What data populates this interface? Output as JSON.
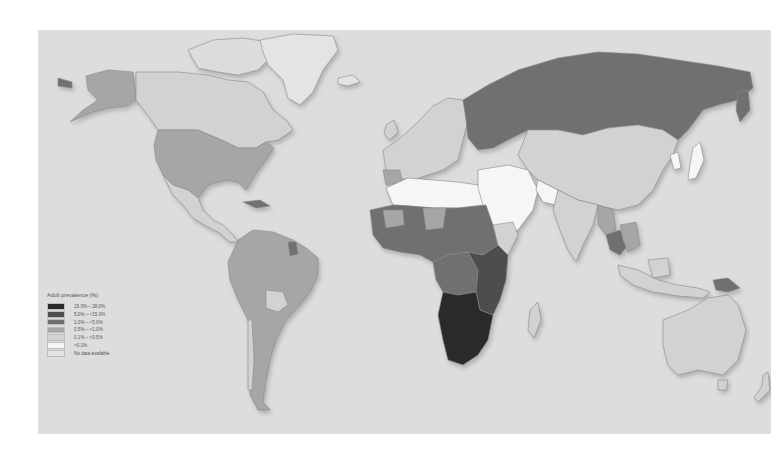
{
  "map": {
    "title": "Adult HIV prevalence world map",
    "ocean_color": "#dddddd",
    "border_color": "#8a8a8a",
    "shadow_color": "#b8b8b8"
  },
  "legend": {
    "title": "Adult prevalence (%)",
    "items": [
      {
        "label": "15.0% – 28.0%",
        "color": "#2a2a2a"
      },
      {
        "label": "5.0% – <15.0%",
        "color": "#4d4d4d"
      },
      {
        "label": "1.0% – <5.0%",
        "color": "#6f6f6f"
      },
      {
        "label": "0.5% – <1.0%",
        "color": "#a6a6a6"
      },
      {
        "label": "0.1% – <0.5%",
        "color": "#d2d2d2"
      },
      {
        "label": "<0.1%",
        "color": "#f6f6f6"
      },
      {
        "label": "No data available",
        "color": "#e4e4e4"
      }
    ]
  },
  "regions": [
    {
      "name": "Greenland",
      "category": "No data available"
    },
    {
      "name": "Canada",
      "category": "0.1% – <0.5%"
    },
    {
      "name": "Alaska / USA",
      "category": "0.5% – <1.0%"
    },
    {
      "name": "Mexico / Central America",
      "category": "0.1% – <0.5%"
    },
    {
      "name": "South America",
      "category": "0.5% – <1.0%"
    },
    {
      "name": "Bolivia",
      "category": "0.1% – <0.5%"
    },
    {
      "name": "Guyana",
      "category": "1.0% – <5.0%"
    },
    {
      "name": "Western Europe",
      "category": "0.1% – <0.5%"
    },
    {
      "name": "Russia",
      "category": "1.0% – <5.0%"
    },
    {
      "name": "North Africa / Middle East",
      "category": "<0.1%"
    },
    {
      "name": "West & Central Africa",
      "category": "1.0% – <5.0%"
    },
    {
      "name": "East Africa",
      "category": "5.0% – <15.0%"
    },
    {
      "name": "Southern Africa",
      "category": "15.0% – 28.0%"
    },
    {
      "name": "Madagascar",
      "category": "0.1% – <0.5%"
    },
    {
      "name": "China / Central Asia",
      "category": "0.1% – <0.5%"
    },
    {
      "name": "India",
      "category": "0.1% – <0.5%"
    },
    {
      "name": "Thailand",
      "category": "1.0% – <5.0%"
    },
    {
      "name": "Japan / Korea",
      "category": "<0.1%"
    },
    {
      "name": "Indonesia",
      "category": "0.1% – <0.5%"
    },
    {
      "name": "Papua New Guinea",
      "category": "1.0% – <5.0%"
    },
    {
      "name": "Australia",
      "category": "0.1% – <0.5%"
    },
    {
      "name": "New Zealand",
      "category": "0.1% – <0.5%"
    }
  ]
}
